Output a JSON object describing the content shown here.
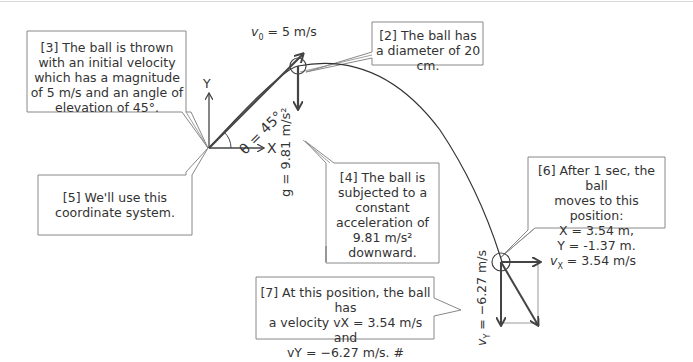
{
  "callouts": {
    "c2": "[2] The ball has a diameter of 20 cm.",
    "c3": "[3] The ball is thrown with an initial velocity which has a magnitude of 5 m/s and an angle of elevation of 45°.",
    "c4_lines": [
      "[4] The ball is",
      "subjected to a",
      "constant",
      "acceleration of",
      "9.81 m/s²",
      "downward."
    ],
    "c5": "[5] We'll use this coordinate system.",
    "c6_lines": [
      "[6] After 1 sec, the ball",
      "moves to this position:",
      "X = 3.54 m,",
      "Y =  -1.37 m."
    ],
    "c7_lines": [
      "[7] At this position, the ball has",
      "a velocity vX = 3.54 m/s and",
      "vY = −6.27 m/s. #"
    ]
  },
  "labels": {
    "v0": "v",
    "v0_sub": "0",
    "v0_value": " = 5 m/s",
    "theta": "θ = 45°",
    "axis_x": "X",
    "axis_y": "Y",
    "g": "g = 9.81 m/s²",
    "vx": "v",
    "vx_sub": "X",
    "vx_value": " = 3.54 m/s",
    "vy": "v",
    "vy_sub": "Y",
    "vy_value": " = −6.27 m/s"
  },
  "physics": {
    "initial_speed_mps": 5,
    "launch_angle_deg": 45,
    "ball_diameter_cm": 20,
    "gravity_mps2": 9.81,
    "time_s": 1,
    "position_x_m": 3.54,
    "position_y_m": -1.37,
    "velocity_x_mps": 3.54,
    "velocity_y_mps": -6.27
  }
}
